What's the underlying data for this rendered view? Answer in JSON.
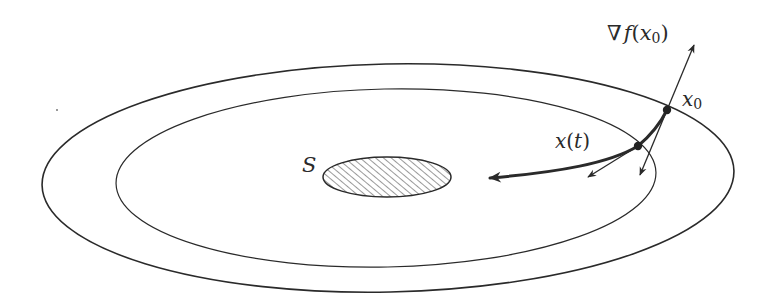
{
  "diagram": {
    "labels": {
      "gradient_nabla": "∇",
      "gradient_f": "f",
      "gradient_open": "(",
      "gradient_x": "x",
      "gradient_sub": "0",
      "gradient_close": ")",
      "x0_x": "x",
      "x0_sub": "0",
      "trajectory_x": "x",
      "trajectory_open": "(",
      "trajectory_t": "t",
      "trajectory_close": ")",
      "set": "S"
    },
    "elements": {
      "outer_level_set": {
        "cx": 388,
        "cy": 178,
        "rx": 346,
        "ry": 114
      },
      "inner_level_set": {
        "cx": 386,
        "cy": 178,
        "rx": 270,
        "ry": 89
      },
      "target_set": {
        "cx": 387,
        "cy": 177,
        "rx": 64,
        "ry": 20,
        "fill": "hatched"
      },
      "point_x0": {
        "x": 667,
        "y": 110
      },
      "point_xt": {
        "x": 638,
        "y": 146
      }
    },
    "colors": {
      "stroke": "#2a2a2a",
      "hatch": "#555555",
      "background": "#ffffff"
    }
  }
}
